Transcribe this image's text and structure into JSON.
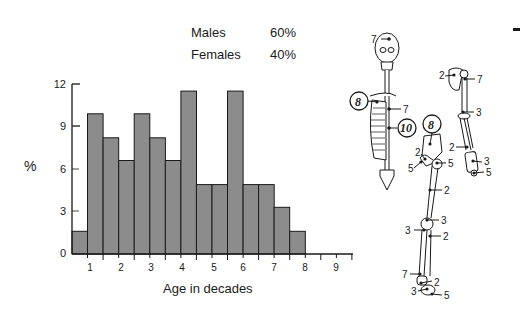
{
  "legend": {
    "rows": [
      {
        "label": "Males",
        "value": "60%"
      },
      {
        "label": "Females",
        "value": "40%"
      }
    ]
  },
  "axes": {
    "ylabel": "%",
    "xlabel": "Age in decades",
    "yticks": [
      "0",
      "3",
      "6",
      "9",
      "12"
    ],
    "xticks": [
      "1",
      "2",
      "3",
      "4",
      "5",
      "6",
      "7",
      "8",
      "9"
    ]
  },
  "colors": {
    "bar_fill": "#8c8c8c",
    "bar_edge": "#1a1a1a",
    "axis": "#1a1a1a"
  },
  "chart_data": {
    "type": "bar",
    "title": "",
    "xlabel": "Age in decades",
    "ylabel": "%",
    "ylim": [
      0,
      12
    ],
    "xlim": [
      0.6,
      9.4
    ],
    "grid": false,
    "legend_position": "top-right (text table)",
    "annotations": [
      "Males 60%",
      "Females 40%"
    ],
    "bin_width_decades": 0.5,
    "categories": [
      "0.6-1.1",
      "1.1-1.6",
      "1.6-2.1",
      "2.1-2.6",
      "2.6-3.1",
      "3.1-3.6",
      "3.6-4.1",
      "4.1-4.6",
      "4.6-5.1",
      "5.1-5.6",
      "5.6-6.1",
      "6.1-6.6",
      "6.6-7.1",
      "7.1-7.6",
      "7.6-8.1"
    ],
    "values": [
      1.6,
      9.9,
      8.2,
      6.6,
      9.9,
      8.2,
      6.6,
      11.5,
      4.9,
      4.9,
      11.5,
      4.9,
      4.9,
      3.3,
      1.6
    ]
  },
  "skeleton": {
    "callouts": [
      {
        "label": "7",
        "site": "skull"
      },
      {
        "label": "8",
        "site": "ribs",
        "circled": true
      },
      {
        "label": "7",
        "site": "thoracic spine"
      },
      {
        "label": "10",
        "site": "lumbar spine",
        "circled": true
      },
      {
        "label": "8",
        "site": "pelvis",
        "circled": true
      },
      {
        "label": "2",
        "site": "femoral head"
      },
      {
        "label": "5",
        "site": "acetabulum"
      },
      {
        "label": "5",
        "site": "greater trochanter"
      },
      {
        "label": "2",
        "site": "femur shaft"
      },
      {
        "label": "3",
        "site": "knee"
      },
      {
        "label": "3",
        "site": "tibia proximal"
      },
      {
        "label": "2",
        "site": "fibula"
      },
      {
        "label": "7",
        "site": "distal tibia"
      },
      {
        "label": "2",
        "site": "ankle"
      },
      {
        "label": "3",
        "site": "talus"
      },
      {
        "label": "5",
        "site": "calcaneus"
      },
      {
        "label": "2",
        "site": "scapula"
      },
      {
        "label": "7",
        "site": "proximal humerus"
      },
      {
        "label": "3",
        "site": "elbow"
      },
      {
        "label": "2",
        "site": "forearm"
      },
      {
        "label": "3",
        "site": "wrist"
      },
      {
        "label": "5",
        "site": "hand"
      }
    ]
  }
}
